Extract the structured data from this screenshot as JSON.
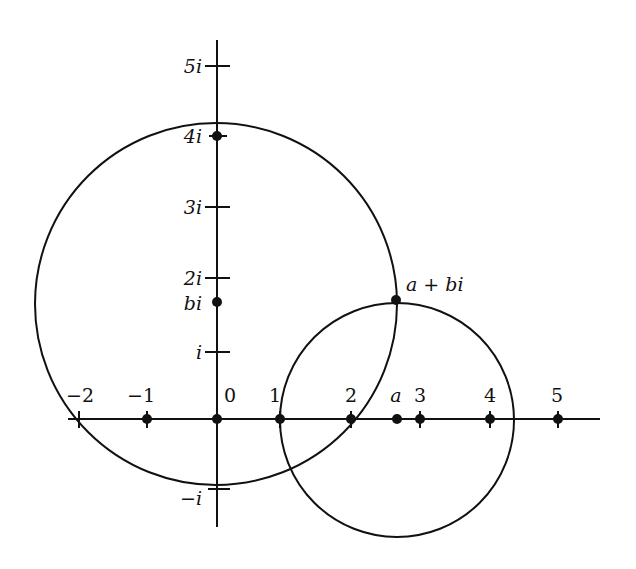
{
  "diagram": {
    "colors": {
      "ink": "#111111",
      "background": "#ffffff"
    },
    "real_axis": {
      "ticks": [
        {
          "label": "−2",
          "value": -2,
          "dot": false
        },
        {
          "label": "−1",
          "value": -1,
          "dot": true
        },
        {
          "label": "0",
          "value": 0,
          "dot": true
        },
        {
          "label": "1",
          "value": 1,
          "dot": true
        },
        {
          "label": "2",
          "value": 2,
          "dot": true
        },
        {
          "label": "3",
          "value": 3,
          "dot": true
        },
        {
          "label": "4",
          "value": 4,
          "dot": true
        },
        {
          "label": "5",
          "value": 5,
          "dot": true
        }
      ]
    },
    "imaginary_axis": {
      "ticks": [
        {
          "label": "5i",
          "value": 5,
          "dot": false
        },
        {
          "label": "4i",
          "value": 4,
          "dot": true
        },
        {
          "label": "3i",
          "value": 3,
          "dot": false
        },
        {
          "label": "2i",
          "value": 2,
          "dot": false
        },
        {
          "label": "i",
          "value": 1,
          "dot": false
        },
        {
          "label": "−i",
          "value": -1,
          "dot": false
        }
      ]
    },
    "points": {
      "a_label": "a",
      "bi_label": "bi",
      "a_plus_bi_label": "a + bi"
    },
    "circles": [
      {
        "name": "circle-centered-bi",
        "center": "bi",
        "passes_through": [
          "a + bi",
          "-2",
          "1",
          "2"
        ]
      },
      {
        "name": "circle-centered-a",
        "center": "a",
        "passes_through": [
          "a + bi",
          "1"
        ]
      }
    ]
  }
}
